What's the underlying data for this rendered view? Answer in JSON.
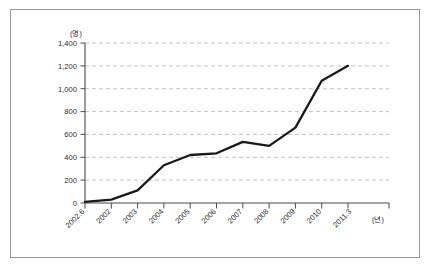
{
  "chart_data": {
    "type": "line",
    "title": "",
    "subtitle": "",
    "xlabel": "(년)",
    "ylabel": "(명)",
    "ylim": [
      0,
      1400
    ],
    "ytick_step": 200,
    "grid": true,
    "legend": "none",
    "categories": [
      "2002.6",
      "2002",
      "2003",
      "2004",
      "2005",
      "2006",
      "2007",
      "2008",
      "2009",
      "2010",
      "2011.3"
    ],
    "values": [
      10,
      30,
      110,
      330,
      420,
      435,
      535,
      500,
      660,
      1070,
      1200
    ],
    "ytick_labels": [
      "0",
      "200",
      "400",
      "600",
      "800",
      "1,000",
      "1,200",
      "1,400"
    ],
    "ytick_values": [
      0,
      200,
      400,
      600,
      800,
      1000,
      1200,
      1400
    ],
    "series": [
      {
        "name": "",
        "values": [
          10,
          30,
          110,
          330,
          420,
          435,
          535,
          500,
          660,
          1070,
          1200
        ]
      }
    ],
    "annotations": []
  },
  "axes": {
    "y_unit_label": "(명)",
    "x_unit_label": "(년)"
  }
}
